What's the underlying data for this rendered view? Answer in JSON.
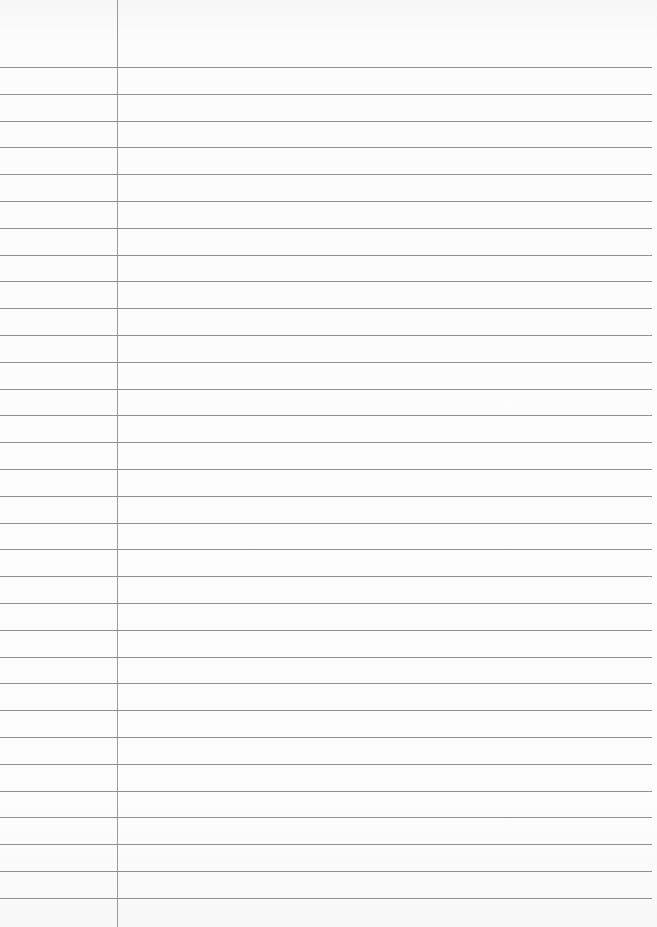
{
  "paper": {
    "type": "lined-paper",
    "rule_color": "#7d7d7d",
    "margin_color": "#8a8a8a",
    "background_color": "#fbfbfb",
    "first_rule_y": 67,
    "rule_spacing": 26.8,
    "rule_count": 32,
    "margin_x": 117,
    "text": ""
  }
}
